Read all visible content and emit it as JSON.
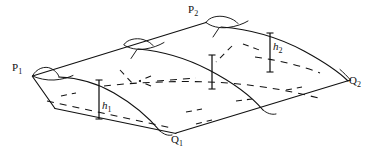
{
  "figure": {
    "kind": "geometry-diagram",
    "background_color": "#ffffff",
    "stroke_color": "#111111",
    "labels": {
      "p1": {
        "base": "P",
        "sub": "1",
        "x": 12,
        "y": 62
      },
      "p2": {
        "base": "P",
        "sub": "2",
        "x": 188,
        "y": 4
      },
      "q1": {
        "base": "Q",
        "sub": "1",
        "x": 171,
        "y": 134
      },
      "q2": {
        "base": "Q",
        "sub": "2",
        "x": 349,
        "y": 75
      },
      "h1": {
        "base": "h",
        "sub": "1",
        "x": 100,
        "y": 100
      },
      "h2": {
        "base": "h",
        "sub": "2",
        "x": 272,
        "y": 41
      }
    },
    "vertices": {
      "p1": {
        "x": 32,
        "y": 76
      },
      "p2": {
        "x": 206,
        "y": 22
      },
      "q1": {
        "x": 176,
        "y": 133
      },
      "q2": {
        "x": 350,
        "y": 80
      }
    },
    "height_bars": [
      {
        "name": "h1",
        "x": 99,
        "top_y": 80,
        "bottom_y": 119
      },
      {
        "name": "h2",
        "x": 270,
        "top_y": 33,
        "bottom_y": 72
      },
      {
        "name": "middle",
        "x": 212,
        "top_y": 55,
        "bottom_y": 89
      }
    ]
  }
}
